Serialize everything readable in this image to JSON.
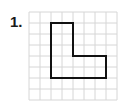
{
  "problem": {
    "number_label": "1."
  },
  "grid": {
    "origin_x": 29,
    "origin_y": 12,
    "cell": 11,
    "cols": 8,
    "rows": 8,
    "line_color": "#d6d6d6"
  },
  "shape": {
    "name": "L-shape",
    "stroke_color": "#111111",
    "vertices_in_cells": [
      [
        2,
        1
      ],
      [
        4,
        1
      ],
      [
        4,
        4
      ],
      [
        7,
        4
      ],
      [
        7,
        6
      ],
      [
        2,
        6
      ]
    ]
  }
}
